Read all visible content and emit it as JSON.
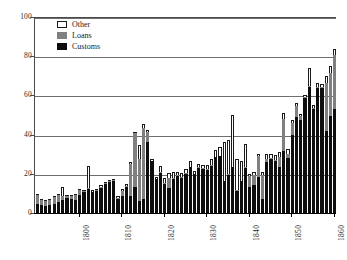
{
  "chart_data": {
    "type": "bar",
    "stacked": true,
    "title": "",
    "subtitle": "",
    "xlabel": "",
    "ylabel": "",
    "xlim": [
      1789.5,
      1860.5
    ],
    "ylim": [
      0,
      100
    ],
    "ytick_values": [
      0,
      20,
      40,
      60,
      80,
      100
    ],
    "ytick_labels": [
      "0",
      "20",
      "40",
      "60",
      "80",
      "100"
    ],
    "xtick_values": [
      1800,
      1810,
      1820,
      1830,
      1840,
      1850,
      1860
    ],
    "xtick_labels": [
      "1800",
      "1810",
      "1820",
      "1830",
      "1840",
      "1850",
      "1860"
    ],
    "grid": "horizontal",
    "legend_position": "top-left",
    "x": [
      1790,
      1791,
      1792,
      1793,
      1794,
      1795,
      1796,
      1797,
      1798,
      1799,
      1800,
      1801,
      1802,
      1803,
      1804,
      1805,
      1806,
      1807,
      1808,
      1809,
      1810,
      1811,
      1812,
      1813,
      1814,
      1815,
      1816,
      1817,
      1818,
      1819,
      1820,
      1821,
      1822,
      1823,
      1824,
      1825,
      1826,
      1827,
      1828,
      1829,
      1830,
      1831,
      1832,
      1833,
      1834,
      1835,
      1836,
      1837,
      1838,
      1839,
      1840,
      1841,
      1842,
      1843,
      1844,
      1845,
      1846,
      1847,
      1848,
      1849,
      1850,
      1851,
      1852,
      1853,
      1854,
      1855,
      1856,
      1857,
      1858,
      1859,
      1860
    ],
    "series": [
      {
        "name": "Customs",
        "color": "#0d0d0d",
        "values": [
          4.4,
          4.0,
          3.4,
          4.3,
          4.8,
          5.6,
          6.6,
          7.5,
          7.1,
          6.6,
          9.1,
          10.8,
          12.4,
          10.5,
          11.1,
          12.9,
          14.7,
          15.8,
          16.4,
          7.3,
          8.6,
          13.3,
          8.9,
          13.2,
          5.9,
          7.3,
          36.3,
          26.3,
          17.2,
          20.3,
          15.0,
          13.0,
          17.6,
          19.1,
          17.9,
          20.1,
          23.3,
          19.7,
          23.2,
          22.7,
          21.9,
          24.2,
          28.5,
          29.0,
          16.2,
          19.4,
          23.4,
          11.2,
          16.2,
          23.1,
          13.5,
          14.5,
          18.2,
          7.0,
          26.2,
          27.5,
          26.7,
          23.7,
          31.8,
          28.3,
          39.7,
          49.0,
          47.3,
          58.9,
          64.2,
          53.0,
          64.0,
          63.9,
          41.8,
          49.6,
          53.2
        ]
      },
      {
        "name": "Loans",
        "color": "#808080",
        "values": [
          5.0,
          2.4,
          2.7,
          2.3,
          3.2,
          3.4,
          2.3,
          1.0,
          1.7,
          2.8,
          2.6,
          0.4,
          0.2,
          0.4,
          0.4,
          0.4,
          0.4,
          0.3,
          0.2,
          0.4,
          2.5,
          0.3,
          16.2,
          27.5,
          21.6,
          36.1,
          5.0,
          0.2,
          0.3,
          0.4,
          0.3,
          5.0,
          0.2,
          0.3,
          0.3,
          0.3,
          0.3,
          0.3,
          0.3,
          0.3,
          0.3,
          0.3,
          0.3,
          0.3,
          0.3,
          0.3,
          0.3,
          0.3,
          0.3,
          0.3,
          5.5,
          5.0,
          10.7,
          12.4,
          1.5,
          0.4,
          0.5,
          5.0,
          16.3,
          2.0,
          6.0,
          5.6,
          2.3,
          0.4,
          0.5,
          0.4,
          0.5,
          0.5,
          24.5,
          22.0,
          27.2
        ]
      },
      {
        "name": "Other",
        "color": "#ffffff",
        "values": [
          0.3,
          0.3,
          0.3,
          0.3,
          0.3,
          0.4,
          4.5,
          0.6,
          0.6,
          0.5,
          0.6,
          0.7,
          11.4,
          0.6,
          1.0,
          0.9,
          0.8,
          1.0,
          0.9,
          1.2,
          1.1,
          1.0,
          0.9,
          0.9,
          7.0,
          2.2,
          1.1,
          1.0,
          1.0,
          3.2,
          2.5,
          2.6,
          3.0,
          1.3,
          2.3,
          2.2,
          2.8,
          1.3,
          1.5,
          1.5,
          2.4,
          3.2,
          3.4,
          4.5,
          19.8,
          17.3,
          26.1,
          16.0,
          10.2,
          11.7,
          1.1,
          1.2,
          1.2,
          1.3,
          2.2,
          2.0,
          2.5,
          2.5,
          3.1,
          2.3,
          1.8,
          1.6,
          0.9,
          1.1,
          9.5,
          1.5,
          1.7,
          1.4,
          3.5,
          3.5,
          3.2
        ]
      }
    ]
  },
  "legend": {
    "entries": [
      {
        "label": "Other",
        "swatch": "other-swatch"
      },
      {
        "label": "Loans",
        "swatch": "loans-swatch"
      },
      {
        "label": "Customs",
        "swatch": "customs-swatch"
      }
    ]
  }
}
